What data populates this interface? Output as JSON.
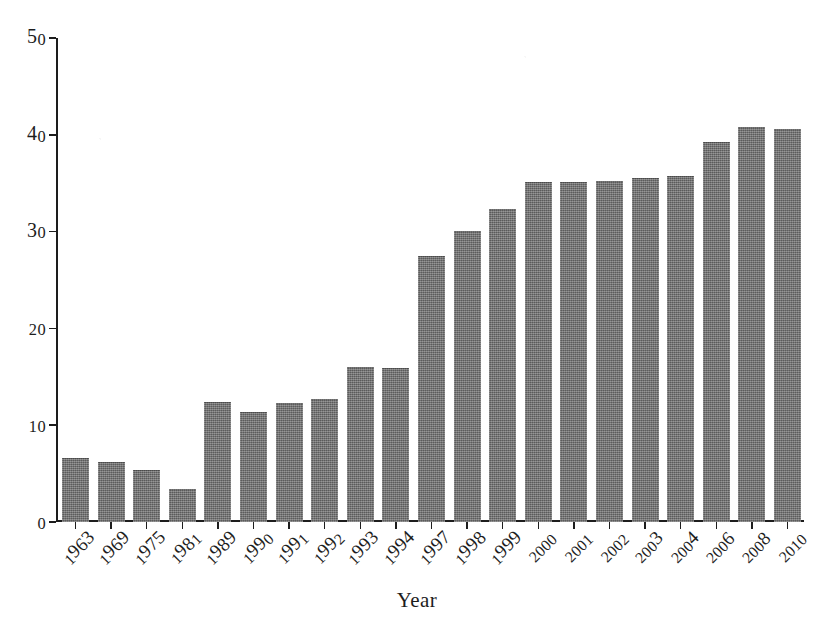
{
  "chart_data": {
    "type": "bar",
    "title": "",
    "subtitle": "",
    "xlabel": "Year",
    "ylabel": "",
    "categories": [
      "1963",
      "1969",
      "1975",
      "1981",
      "1989",
      "1990",
      "1991",
      "1992",
      "1993",
      "1994",
      "1997",
      "1998",
      "1999",
      "2000",
      "2001",
      "2002",
      "2003",
      "2004",
      "2006",
      "2008",
      "2010"
    ],
    "values": [
      6.6,
      6.2,
      5.4,
      3.4,
      12.4,
      11.4,
      12.3,
      12.7,
      16.0,
      15.9,
      27.5,
      30.1,
      32.3,
      35.1,
      35.1,
      35.2,
      35.5,
      35.7,
      39.3,
      40.8,
      40.6
    ],
    "ylim": [
      0,
      50
    ],
    "yticks": [
      0,
      10,
      20,
      30,
      40,
      50
    ],
    "ytick_labels": [
      "0",
      "10",
      "20",
      "30",
      "40",
      "50"
    ],
    "grid": false,
    "legend": null,
    "bar_color": "#6e6e6e",
    "axis_color": "#1d1d1d",
    "background": "#ffffff",
    "annotations": []
  },
  "axis": {
    "x_title": "Year"
  }
}
